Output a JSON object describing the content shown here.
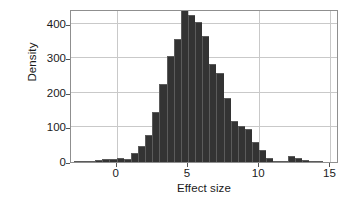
{
  "chart_data": {
    "type": "bar",
    "title": "",
    "subtitle": "",
    "xlabel": "Effect size",
    "ylabel": "Density",
    "xlim": [
      -3.2,
      15.6
    ],
    "ylim": [
      0,
      443
    ],
    "grid": true,
    "legend": null,
    "bin_width": 0.5,
    "bar_color": "#333333",
    "bar_edge_color": "#5b5b5b",
    "grid_color": "#c9c9c9",
    "frame_color": "#8f8f8f",
    "xticks": [
      {
        "value": 0,
        "label": "0"
      },
      {
        "value": 5,
        "label": "5"
      },
      {
        "value": 10,
        "label": "10"
      },
      {
        "value": 15,
        "label": "15"
      }
    ],
    "yticks": [
      {
        "value": 0,
        "label": "0"
      },
      {
        "value": 100,
        "label": "100"
      },
      {
        "value": 200,
        "label": "200"
      },
      {
        "value": 300,
        "label": "300"
      },
      {
        "value": 400,
        "label": "400"
      }
    ],
    "bins": [
      {
        "x0": -3.0,
        "x1": -2.5,
        "value": 1
      },
      {
        "x0": -2.5,
        "x1": -2.0,
        "value": 2
      },
      {
        "x0": -2.0,
        "x1": -1.5,
        "value": 3
      },
      {
        "x0": -1.5,
        "x1": -1.0,
        "value": 5
      },
      {
        "x0": -1.0,
        "x1": -0.5,
        "value": 10
      },
      {
        "x0": -0.5,
        "x1": 0.0,
        "value": 8
      },
      {
        "x0": 0.0,
        "x1": 0.5,
        "value": 11
      },
      {
        "x0": 0.5,
        "x1": 1.0,
        "value": 10
      },
      {
        "x0": 1.0,
        "x1": 1.5,
        "value": 27
      },
      {
        "x0": 1.5,
        "x1": 2.0,
        "value": 46
      },
      {
        "x0": 2.0,
        "x1": 2.5,
        "value": 78
      },
      {
        "x0": 2.5,
        "x1": 3.0,
        "value": 146
      },
      {
        "x0": 3.0,
        "x1": 3.5,
        "value": 226
      },
      {
        "x0": 3.5,
        "x1": 4.0,
        "value": 308
      },
      {
        "x0": 4.0,
        "x1": 4.5,
        "value": 355
      },
      {
        "x0": 4.5,
        "x1": 5.0,
        "value": 443
      },
      {
        "x0": 5.0,
        "x1": 5.5,
        "value": 427
      },
      {
        "x0": 5.5,
        "x1": 6.0,
        "value": 405
      },
      {
        "x0": 6.0,
        "x1": 6.5,
        "value": 366
      },
      {
        "x0": 6.5,
        "x1": 7.0,
        "value": 284
      },
      {
        "x0": 7.0,
        "x1": 7.5,
        "value": 257
      },
      {
        "x0": 7.5,
        "x1": 8.0,
        "value": 184
      },
      {
        "x0": 8.0,
        "x1": 8.5,
        "value": 120
      },
      {
        "x0": 8.5,
        "x1": 9.0,
        "value": 103
      },
      {
        "x0": 9.0,
        "x1": 9.5,
        "value": 97
      },
      {
        "x0": 9.5,
        "x1": 10.0,
        "value": 57
      },
      {
        "x0": 10.0,
        "x1": 10.5,
        "value": 36
      },
      {
        "x0": 10.5,
        "x1": 11.0,
        "value": 13
      },
      {
        "x0": 11.0,
        "x1": 11.5,
        "value": 4
      },
      {
        "x0": 11.5,
        "x1": 12.0,
        "value": 2
      },
      {
        "x0": 12.0,
        "x1": 12.5,
        "value": 17
      },
      {
        "x0": 12.5,
        "x1": 13.0,
        "value": 11
      },
      {
        "x0": 13.0,
        "x1": 13.5,
        "value": 6
      },
      {
        "x0": 13.5,
        "x1": 14.0,
        "value": 4
      },
      {
        "x0": 14.0,
        "x1": 14.5,
        "value": 1
      }
    ]
  }
}
